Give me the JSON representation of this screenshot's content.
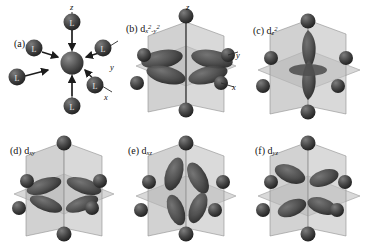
{
  "figure": {
    "type": "scientific-diagram",
    "layout": "2 rows x 3 columns",
    "background_color": "#ffffff",
    "colors": {
      "orbital_lobe": "#4a4a4a",
      "orbital_lobe_dark": "#2e2e2e",
      "ligand_sphere": "#3a3a3a",
      "metal_sphere": "#4f4f4f",
      "plane_fill": "#b8b8b8",
      "plane_fill_light": "#cccccc",
      "axis_line": "#2b2b2b",
      "text": "#111111"
    }
  },
  "panels": [
    {
      "id": "a",
      "tag": "(a)",
      "orbital_label": "",
      "caption": "(a)",
      "description": "Octahedral complex: six ligands approaching a central metal ion along the x, y and z axes",
      "axis_labels": [
        "z",
        "y",
        "x"
      ],
      "ligand_label": "L",
      "ligand_count": 6,
      "has_planes": false,
      "has_arrows": true
    },
    {
      "id": "b",
      "tag": "(b)",
      "orbital_label": "d",
      "orbital_sub": "x",
      "orbital_sup1": "2",
      "orbital_mid": "-y",
      "orbital_sup2": "2",
      "orbital_full": "d x2-y2",
      "caption": "(b) d x²–y²",
      "description": "d(x2-y2) orbital: four lobes pointing along the x and y axes directly at the ligands",
      "axis_labels": [
        "z",
        "y",
        "x"
      ],
      "ligand_count": 6,
      "has_planes": true,
      "lobe_count": 4
    },
    {
      "id": "c",
      "tag": "(c)",
      "orbital_label": "d",
      "orbital_sup1": "z",
      "orbital_sup2": "2",
      "orbital_full": "d z2",
      "caption": "(c) d z²",
      "description": "d(z2) orbital: two large lobes along the z axis with an equatorial torus in the xy plane",
      "axis_labels": [],
      "ligand_count": 6,
      "has_planes": true,
      "lobe_count": 2,
      "has_torus": true
    },
    {
      "id": "d",
      "tag": "(d)",
      "orbital_label": "d",
      "orbital_sub": "xy",
      "orbital_full": "d xy",
      "caption": "(d) d xy",
      "description": "d(xy) orbital: four lobes lying in the xy plane, pointing between the axes",
      "axis_labels": [],
      "ligand_count": 6,
      "has_planes": true,
      "lobe_count": 4
    },
    {
      "id": "e",
      "tag": "(e)",
      "orbital_label": "d",
      "orbital_sub": "xz",
      "orbital_full": "d xz",
      "caption": "(e) d xz",
      "description": "d(xz) orbital: four lobes lying in the xz plane, pointing between the axes",
      "axis_labels": [],
      "ligand_count": 6,
      "has_planes": true,
      "lobe_count": 4
    },
    {
      "id": "f",
      "tag": "(f)",
      "orbital_label": "d",
      "orbital_sub": "yz",
      "orbital_full": "d yz",
      "caption": "(f) d yz",
      "description": "d(yz) orbital: four lobes lying in the yz plane, pointing between the axes",
      "axis_labels": [],
      "ligand_count": 6,
      "has_planes": true,
      "lobe_count": 4
    }
  ]
}
